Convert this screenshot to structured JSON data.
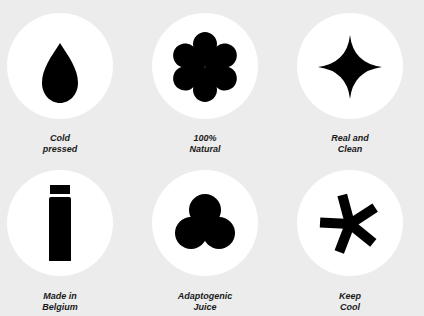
{
  "features": [
    {
      "icon": "drop-icon",
      "line1": "Cold",
      "line2": "pressed"
    },
    {
      "icon": "flower-icon",
      "line1": "100%",
      "line2": "Natural"
    },
    {
      "icon": "sparkle-icon",
      "line1": "Real and",
      "line2": "Clean"
    },
    {
      "icon": "bottle-icon",
      "line1": "Made in",
      "line2": "Belgium"
    },
    {
      "icon": "trefoil-icon",
      "line1": "Adaptogenic",
      "line2": "Juice"
    },
    {
      "icon": "asterisk-icon",
      "line1": "Keep",
      "line2": "Cool"
    }
  ],
  "colors": {
    "background": "#ececec",
    "circle": "#ffffff",
    "icon": "#000000"
  }
}
